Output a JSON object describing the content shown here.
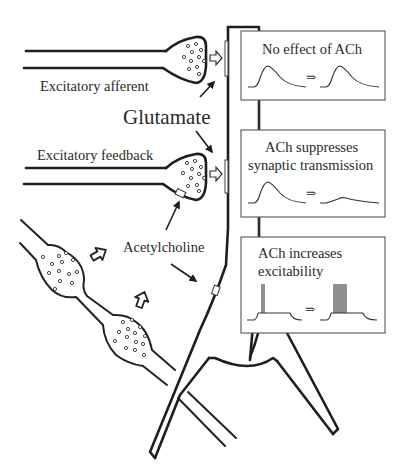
{
  "diagram": {
    "labels": {
      "excitatory_afferent": "Excitatory afferent",
      "glutamate": "Glutamate",
      "excitatory_feedback": "Excitatory feedback",
      "acetylcholine": "Acetylcholine"
    },
    "boxes": [
      {
        "id": "no-effect",
        "lines": [
          "No effect of ACh"
        ],
        "trace_type": "epsp-unchanged",
        "arrow_glyph": "⇒"
      },
      {
        "id": "suppresses-transmission",
        "lines": [
          "ACh suppresses",
          "synaptic transmission"
        ],
        "trace_type": "epsp-reduced",
        "arrow_glyph": "⇒"
      },
      {
        "id": "increases-excitability",
        "lines": [
          "ACh increases",
          "excitability"
        ],
        "trace_type": "spikes-increased",
        "arrow_glyph": "⇒"
      }
    ],
    "elements": {
      "afferent_axon": "excitatory-afferent-axon",
      "feedback_axon": "excitatory-feedback-axon",
      "cholinergic_axon": "cholinergic-axon",
      "pyramidal_neuron": "pyramidal-neuron"
    },
    "colors": {
      "line": "#1e1e1e",
      "text": "#2a2a2a",
      "box_border": "#555555",
      "background": "#ffffff"
    }
  }
}
